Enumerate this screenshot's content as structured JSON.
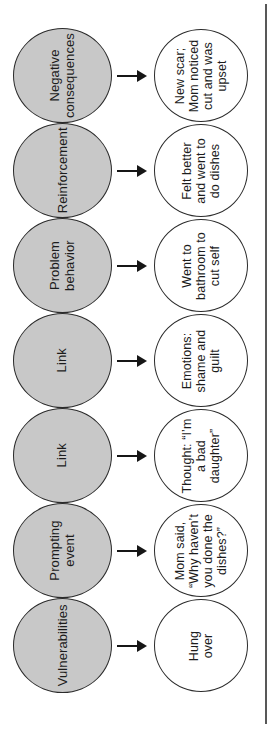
{
  "diagram": {
    "colors": {
      "stage_fill": "#c8c8c8",
      "detail_fill": "#ffffff",
      "outline": "#2b2b2b",
      "arrow": "#161616",
      "edge_rule": "#585858"
    },
    "rows": [
      {
        "stage": [
          "Negative",
          "consequences"
        ],
        "detail": [
          "New scar;",
          "Mom noticed",
          "cut and was",
          "upset"
        ]
      },
      {
        "stage": [
          "Reinforcement"
        ],
        "detail": [
          "Felt better",
          "and went to",
          "do dishes"
        ]
      },
      {
        "stage": [
          "Problem",
          "behavior"
        ],
        "detail": [
          "Went to",
          "bathroom to",
          "cut self"
        ]
      },
      {
        "stage": [
          "Link"
        ],
        "detail": [
          "Emotions:",
          "shame and",
          "guilt"
        ]
      },
      {
        "stage": [
          "Link"
        ],
        "detail": [
          "Thought: “I’m",
          "a bad",
          "daughter”"
        ]
      },
      {
        "stage": [
          "Prompting",
          "event"
        ],
        "detail": [
          "Mom said,",
          "“Why haven’t",
          "you done the",
          "dishes?”"
        ]
      },
      {
        "stage": [
          "Vulnerabilities"
        ],
        "detail": [
          "Hung",
          "over"
        ]
      }
    ]
  }
}
